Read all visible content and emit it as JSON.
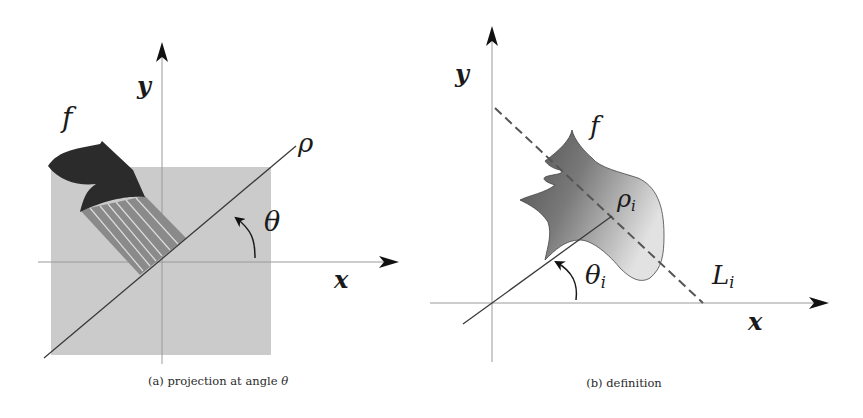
{
  "panels": [
    {
      "id": "a",
      "caption_prefix": "(a) projection at angle ",
      "caption_symbol": "θ",
      "labels": {
        "y_axis": "y",
        "x_axis": "x",
        "function": "f",
        "rho": "ρ",
        "theta": "θ"
      },
      "colors": {
        "square_fill": "#c9c9c9",
        "shape_fill": "#2b2b2b",
        "projection_fill": "#8a8a8a",
        "projection_lines": "#d8d8d8",
        "axis": "#9a9a9a",
        "line": "#3a3a3a"
      }
    },
    {
      "id": "b",
      "caption": "(b) definition",
      "labels": {
        "y_axis": "y",
        "x_axis": "x",
        "function": "f",
        "rho": "ρ",
        "rho_sub": "i",
        "theta": "θ",
        "theta_sub": "i",
        "line": "L",
        "line_sub": "i"
      },
      "colors": {
        "shape_dark": "#5a5a5a",
        "shape_light": "#d2d2d2",
        "dashed_line": "#555555",
        "axis": "#9a9a9a",
        "line": "#3a3a3a"
      }
    }
  ]
}
